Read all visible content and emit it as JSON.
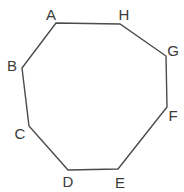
{
  "diagram": {
    "type": "octagon",
    "stroke_color": "#4a4a4a",
    "fill_color": "none",
    "label_color": "#3a3a3a",
    "vertices": [
      {
        "name": "A",
        "x": 56,
        "y": 23,
        "lx": 51,
        "ly": 20
      },
      {
        "name": "H",
        "x": 120,
        "y": 24,
        "lx": 124,
        "ly": 20
      },
      {
        "name": "G",
        "x": 166,
        "y": 56,
        "lx": 173,
        "ly": 56
      },
      {
        "name": "F",
        "x": 167,
        "y": 107,
        "lx": 173,
        "ly": 121
      },
      {
        "name": "E",
        "x": 118,
        "y": 169,
        "lx": 120,
        "ly": 188
      },
      {
        "name": "D",
        "x": 68,
        "y": 170,
        "lx": 68,
        "ly": 187
      },
      {
        "name": "C",
        "x": 29,
        "y": 126,
        "lx": 20,
        "ly": 139
      },
      {
        "name": "B",
        "x": 22,
        "y": 68,
        "lx": 12,
        "ly": 71
      }
    ]
  }
}
